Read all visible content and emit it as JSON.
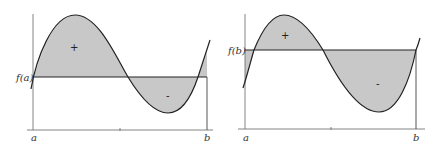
{
  "colors": {
    "fill": "#c8c8c8",
    "line": "#222222",
    "axis": "#555555",
    "background": "#ffffff"
  },
  "panels": [
    {
      "id": "left",
      "reference_label": "f(a)",
      "x_labels": {
        "start": "a",
        "end": "b"
      },
      "positive_sign": "+",
      "negative_sign": "-"
    },
    {
      "id": "right",
      "reference_label": "f(b)",
      "x_labels": {
        "start": "a",
        "end": "b"
      },
      "positive_sign": "+",
      "negative_sign": "-"
    }
  ]
}
